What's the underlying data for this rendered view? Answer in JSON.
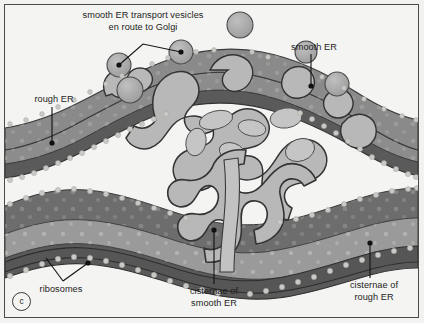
{
  "figure": {
    "panel_letter": "c",
    "background_color": "#f2f2f0",
    "frame_color": "#4a4a4a"
  },
  "labels": {
    "transport_vesicles": "smooth ER transport vesicles\nen route to Golgi",
    "smooth_er": "smooth ER",
    "rough_er": "rough ER",
    "ribosomes": "ribosomes",
    "cisternae_smooth_er": "cisternae of\nsmooth ER",
    "cisternae_rough_er": "cisternae of\nrough ER"
  },
  "colors": {
    "membrane_outline": "#3a3a3a",
    "rough_er_lumen_dark": "#6e6e6e",
    "rough_er_lumen_mid": "#8e8e8e",
    "rough_er_membrane": "#5a5a5a",
    "smooth_er_tubule": "#b4b4b4",
    "smooth_er_inner": "#9a9a9a",
    "vesicle_fill": "#a8a8a8",
    "ribosome_dot": "#c9c9c5",
    "leader_line": "#111111",
    "text": "#1d1d1d"
  },
  "structures": {
    "vesicle_count_free": 6,
    "labeled_vesicle_count": 2,
    "er_sheet_count": 3
  }
}
